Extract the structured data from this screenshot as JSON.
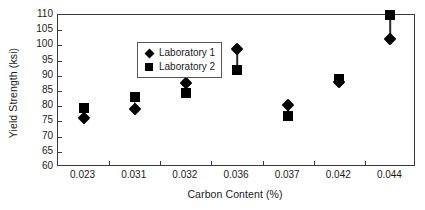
{
  "chart_data": {
    "type": "scatter",
    "title": "",
    "xlabel": "Carbon Content (%)",
    "ylabel": "Yield Strength (ksi)",
    "categories": [
      "0.023",
      "0.031",
      "0.032",
      "0.036",
      "0.037",
      "0.042",
      "0.044"
    ],
    "ylim": [
      60,
      110
    ],
    "yticks": [
      60,
      65,
      70,
      75,
      80,
      85,
      90,
      95,
      100,
      105,
      110
    ],
    "ytick_labels": [
      "60",
      "65",
      "70",
      "75",
      "80",
      "85",
      "90",
      "95",
      "100",
      "105",
      "110"
    ],
    "grid": false,
    "legend_position": "upper left inside",
    "series": [
      {
        "name": "Laboratory 1",
        "marker": "diamond",
        "color": "#000000",
        "values": [
          76.0,
          79.0,
          87.5,
          98.7,
          80.5,
          88.0,
          102.0
        ]
      },
      {
        "name": "Laboratory 2",
        "marker": "square",
        "color": "#000000",
        "values": [
          79.5,
          83.0,
          84.2,
          92.0,
          76.7,
          89.0,
          110.0
        ]
      }
    ]
  },
  "legend": {
    "items": [
      {
        "label": "Laboratory 1",
        "marker": "diamond"
      },
      {
        "label": "Laboratory 2",
        "marker": "square"
      }
    ]
  }
}
